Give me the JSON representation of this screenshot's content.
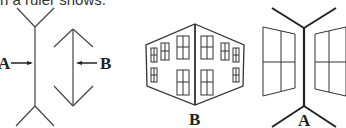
{
  "caption": {
    "text": "n a ruler shows."
  },
  "figures": {
    "lines": {
      "label_a": "A",
      "label_b": "B"
    },
    "building_outside": {
      "label": "B"
    },
    "building_inside": {
      "label": "A"
    }
  },
  "colors": {
    "ink": "#222222",
    "background": "#ffffff"
  }
}
